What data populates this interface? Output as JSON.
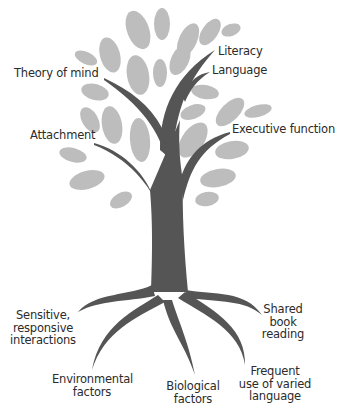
{
  "colors": {
    "leaf": "#bdbdbd",
    "trunk": "#555555",
    "text": "#2b2b2b",
    "background": "#ffffff"
  },
  "branches": {
    "literacy": "Literacy",
    "language": "Language",
    "theory_of_mind": "Theory of mind",
    "attachment": "Attachment",
    "executive_function": "Executive function"
  },
  "roots": {
    "sensitive": [
      "Sensitive,",
      "responsive",
      "interactions"
    ],
    "environmental": [
      "Environmental",
      "factors"
    ],
    "biological": [
      "Biological",
      "factors"
    ],
    "shared_book": [
      "Shared",
      "book",
      "reading"
    ],
    "frequent": [
      "Frequent",
      "use of varied",
      "language"
    ]
  }
}
